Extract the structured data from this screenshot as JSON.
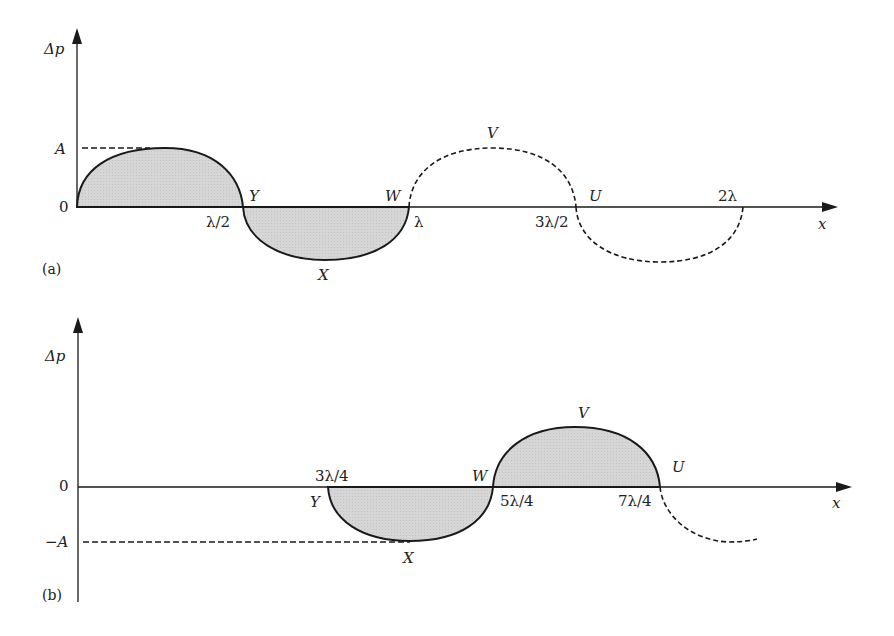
{
  "figure": {
    "panels": [
      {
        "id": "a",
        "tag": "(a)",
        "y_axis_label": "Δp",
        "x_axis_label": "x",
        "y_ticks": {
          "amplitude": "A",
          "zero": "0"
        },
        "x_ticks": [
          "λ/2",
          "λ",
          "3λ/2",
          "2λ"
        ],
        "points": {
          "Y": "Y",
          "X": "X",
          "W": "W",
          "V": "V",
          "U": "U"
        }
      },
      {
        "id": "b",
        "tag": "(b)",
        "y_axis_label": "Δp",
        "x_axis_label": "x",
        "y_ticks": {
          "zero": "0",
          "neg_amplitude": "−A"
        },
        "x_ticks": [
          "3λ/4",
          "5λ/4",
          "7λ/4"
        ],
        "points": {
          "Y": "Y",
          "X": "X",
          "W": "W",
          "V": "V",
          "U": "U"
        }
      }
    ],
    "colors": {
      "stroke": "#1a1a1a",
      "fill": "#d4d4d4",
      "background": "#ffffff"
    }
  }
}
